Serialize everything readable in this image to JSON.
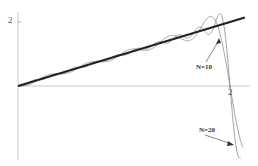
{
  "chart_data": {
    "type": "line",
    "title": "",
    "xlabel": "",
    "ylabel": "",
    "xlim": [
      0,
      2.25
    ],
    "ylim": [
      -2.5,
      2.6
    ],
    "grid": false,
    "legend": null,
    "x_ticks": [
      {
        "value": 2,
        "label": "2"
      }
    ],
    "y_ticks": [
      {
        "value": 2,
        "label": "2"
      }
    ],
    "series": [
      {
        "name": "f(x) = x",
        "style": "thick-dark",
        "x": [
          0,
          2.14
        ],
        "y": [
          0,
          2.14
        ]
      },
      {
        "name": "N=10",
        "style": "thin-gray",
        "description": "Partial Fourier sine sum with 10 terms; oscillates about y=x, overshoots near x≈1.9 (Gibbs), drops through 0 at x=2"
      },
      {
        "name": "N=20",
        "style": "thin-gray",
        "description": "Partial Fourier sine sum with 20 terms; tighter oscillation, sharper overshoot, drops to about -2 just past x=2"
      }
    ],
    "annotations": [
      {
        "text": "N=10",
        "arrow_to": [
          1.87,
          1.75
        ]
      },
      {
        "text": "N=20",
        "arrow_to": [
          2.08,
          -1.5
        ]
      }
    ]
  },
  "labels": {
    "y_tick_2": "2",
    "x_tick_2": "2",
    "ann_n10": "N=10",
    "ann_n20": "N=20"
  },
  "colors": {
    "main_line": "#222222",
    "series_line": "#8a8a8a",
    "axis": "#c8c8c8"
  }
}
